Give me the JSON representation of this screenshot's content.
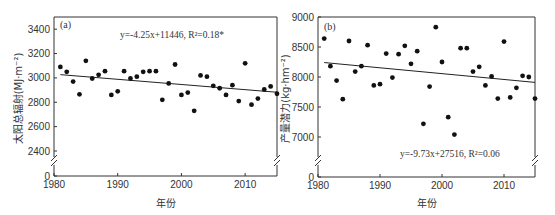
{
  "chart_data": [
    {
      "type": "scatter",
      "panel_label": "(a)",
      "title": "",
      "xlabel": "年份",
      "ylabel": "太阳总辐射(MJ·m⁻²)",
      "xlim": [
        1980,
        2015
      ],
      "ylim_upper": [
        2400,
        3500
      ],
      "y_break": true,
      "x_ticks": [
        1980,
        1990,
        2000,
        2010
      ],
      "y_ticks": [
        0,
        2400,
        2600,
        2800,
        3000,
        3200,
        3400
      ],
      "grid": false,
      "annotation": "y=-4.25x+11446, R²=0.18*",
      "trendline": {
        "slope": -4.25,
        "intercept": 11446
      },
      "x": [
        1981,
        1982,
        1983,
        1984,
        1985,
        1986,
        1987,
        1988,
        1989,
        1990,
        1991,
        1992,
        1993,
        1994,
        1995,
        1996,
        1997,
        1998,
        1999,
        2000,
        2001,
        2002,
        2003,
        2004,
        2005,
        2006,
        2007,
        2008,
        2009,
        2010,
        2011,
        2012,
        2013,
        2014,
        2015
      ],
      "values": [
        3090,
        3050,
        2970,
        2865,
        3140,
        2995,
        3025,
        3055,
        2860,
        2890,
        3055,
        2995,
        3010,
        3050,
        3055,
        3055,
        2820,
        2955,
        3110,
        2860,
        2880,
        2730,
        3020,
        3010,
        2935,
        2915,
        2860,
        2940,
        2810,
        3120,
        2780,
        2830,
        2905,
        2930,
        2870
      ]
    },
    {
      "type": "scatter",
      "panel_label": "(b)",
      "title": "",
      "xlabel": "年份",
      "ylabel": "产量潜力(kg·hm⁻²)",
      "xlim": [
        1980,
        2015
      ],
      "ylim_upper": [
        6500,
        9000
      ],
      "y_break": true,
      "x_ticks": [
        1980,
        1990,
        2000,
        2010
      ],
      "y_ticks": [
        0,
        7000,
        7500,
        8000,
        8500,
        9000
      ],
      "grid": false,
      "annotation": "y=-9.73x+27516, R²=0.06",
      "trendline": {
        "slope": -9.73,
        "intercept": 27516
      },
      "x": [
        1981,
        1982,
        1983,
        1984,
        1985,
        1986,
        1987,
        1988,
        1989,
        1990,
        1991,
        1992,
        1993,
        1994,
        1995,
        1996,
        1997,
        1998,
        1999,
        2000,
        2001,
        2002,
        2003,
        2004,
        2005,
        2006,
        2007,
        2008,
        2009,
        2010,
        2011,
        2012,
        2013,
        2014,
        2015
      ],
      "values": [
        8640,
        8180,
        7940,
        7630,
        8600,
        8090,
        8180,
        8530,
        7860,
        7880,
        8390,
        7990,
        8380,
        8520,
        8220,
        8430,
        7220,
        7840,
        8830,
        8250,
        7330,
        7040,
        8480,
        8480,
        8090,
        8170,
        7860,
        8010,
        7640,
        8590,
        7660,
        7820,
        8020,
        8000,
        7640
      ]
    }
  ],
  "panels": {
    "a": {
      "label": "(a)",
      "ylabel": "太阳总辐射(MJ·m⁻²)",
      "xlabel": "年份",
      "equation": "y=-4.25x+11446, R²=0.18*"
    },
    "b": {
      "label": "(b)",
      "ylabel": "产量潜力(kg·hm⁻²)",
      "xlabel": "年份",
      "equation": "y=-9.73x+27516, R²=0.06"
    }
  }
}
